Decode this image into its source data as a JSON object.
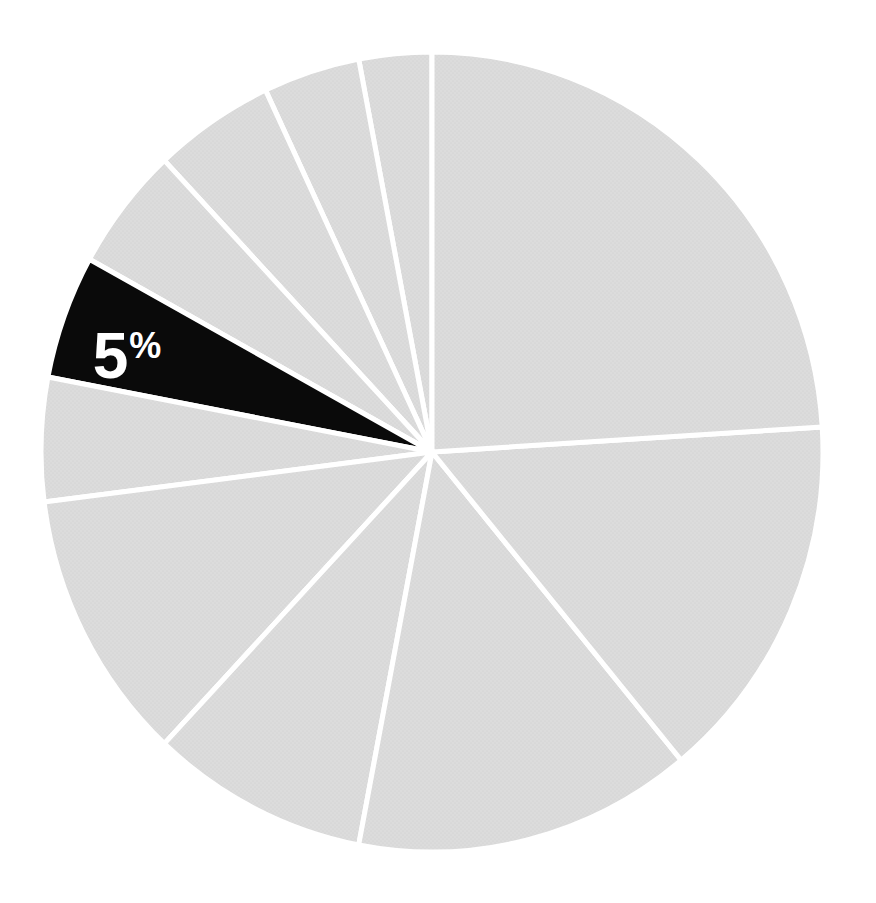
{
  "page": {
    "background_color": "#ffffff",
    "width": 876,
    "height": 903
  },
  "chart_data": {
    "type": "pie",
    "title": "",
    "xlabel": "",
    "ylabel": "",
    "legend": "none",
    "direction": "counterclockwise",
    "start_position": "12-oclock",
    "center": {
      "x": 432,
      "y": 452
    },
    "radius_x": 391,
    "radius_y": 400,
    "separator_color": "#ffffff",
    "separator_width": 5,
    "default_slice_color": "#dcdcdc",
    "halftone_dot_color": "#cdcdcd",
    "highlight_slice_color": "#0a0a0a",
    "label_color": "#ffffff",
    "label_font_size": 64,
    "label_suffix_font_size": 36,
    "slices": [
      {
        "percent": 3,
        "highlight": false
      },
      {
        "percent": 4,
        "highlight": false
      },
      {
        "percent": 5,
        "highlight": false
      },
      {
        "percent": 5,
        "highlight": false
      },
      {
        "percent": 5,
        "highlight": true,
        "label_value": "5",
        "label_suffix": "%",
        "label_x": 127,
        "label_y": 355
      },
      {
        "percent": 5,
        "highlight": false
      },
      {
        "percent": 11,
        "highlight": false
      },
      {
        "percent": 9,
        "highlight": false
      },
      {
        "percent": 14,
        "highlight": false
      },
      {
        "percent": 15,
        "highlight": false
      },
      {
        "percent": 24,
        "highlight": false
      }
    ]
  }
}
